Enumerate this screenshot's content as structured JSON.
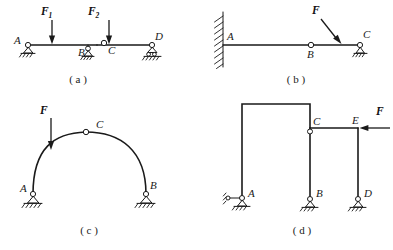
{
  "figure": {
    "panels": [
      {
        "id": "a",
        "caption": "( a )",
        "description": "Horizontal compound beam A-B-C-D with two vertical downward loads",
        "joint_labels": [
          "A",
          "B",
          "C",
          "D"
        ],
        "force_labels": [
          {
            "symbol": "F",
            "subscript": "1",
            "direction": "down"
          },
          {
            "symbol": "F",
            "subscript": "2",
            "direction": "down"
          }
        ],
        "supports": [
          "pin-A",
          "pin-B",
          "roller-D"
        ],
        "hinges": [
          "C"
        ]
      },
      {
        "id": "b",
        "caption": "( b )",
        "description": "Cantilever beam fixed into wall at A with internal hinge B and pin support C, inclined load F",
        "joint_labels": [
          "A",
          "B",
          "C"
        ],
        "force_labels": [
          {
            "symbol": "F",
            "subscript": "",
            "direction": "down-right"
          }
        ],
        "supports": [
          "fixed-wall-A",
          "pin-C"
        ],
        "hinges": [
          "B"
        ]
      },
      {
        "id": "c",
        "caption": "( c )",
        "description": "Three-hinged arch with pin supports A and B and crown hinge C, vertical load F",
        "joint_labels": [
          "A",
          "B",
          "C"
        ],
        "force_labels": [
          {
            "symbol": "F",
            "subscript": "",
            "direction": "down"
          }
        ],
        "supports": [
          "pin-A",
          "pin-B"
        ],
        "hinges": [
          "C"
        ]
      },
      {
        "id": "d",
        "caption": "( d )",
        "description": "Frame with columns A, B, D, hinge at C, horizontal load F applied leftward at E",
        "joint_labels": [
          "A",
          "B",
          "C",
          "D",
          "E"
        ],
        "force_labels": [
          {
            "symbol": "F",
            "subscript": "",
            "direction": "left"
          }
        ],
        "supports": [
          "link-pin-A",
          "pin-B",
          "pin-D"
        ],
        "hinges": [
          "C"
        ]
      }
    ]
  },
  "colors": {
    "ink": "#1a1a1a",
    "paper": "#ffffff"
  }
}
